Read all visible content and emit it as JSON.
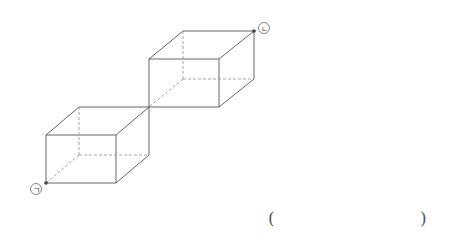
{
  "diagram": {
    "line_color": "#555555",
    "hidden_line_color": "#9a9a9a",
    "point_color": "#444444",
    "labels": {
      "start": "ㄱ",
      "end": "ㄴ"
    },
    "cuboids": [
      {
        "name": "lower-cuboid",
        "front": [
          [
            46,
            135
          ],
          [
            116,
            135
          ],
          [
            116,
            183
          ],
          [
            46,
            183
          ]
        ],
        "back": [
          [
            79,
            107
          ],
          [
            149,
            107
          ],
          [
            149,
            155
          ],
          [
            79,
            155
          ]
        ]
      },
      {
        "name": "upper-cuboid",
        "front": [
          [
            149,
            59
          ],
          [
            219,
            59
          ],
          [
            219,
            107
          ],
          [
            149,
            107
          ]
        ],
        "back": [
          [
            183,
            31
          ],
          [
            254,
            31
          ],
          [
            254,
            79
          ],
          [
            183,
            79
          ]
        ]
      }
    ],
    "points": [
      {
        "label": "ㄱ",
        "x": 46,
        "y": 183
      },
      {
        "label": "ㄴ",
        "x": 254,
        "y": 31
      }
    ]
  },
  "answer": {
    "open_paren": "(",
    "close_paren": ")",
    "value": ""
  }
}
